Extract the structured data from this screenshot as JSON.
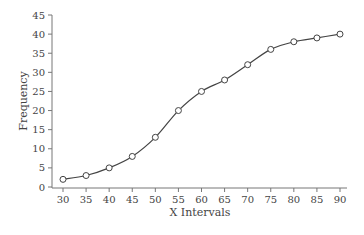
{
  "chart_data": {
    "type": "line",
    "title": "",
    "xlabel": "X Intervals",
    "ylabel": "Frequency",
    "x": [
      30,
      35,
      40,
      45,
      50,
      55,
      60,
      65,
      70,
      75,
      80,
      85,
      90
    ],
    "series": [
      {
        "name": "Frequency",
        "values": [
          2,
          3,
          5,
          8,
          13,
          20,
          25,
          28,
          32,
          36,
          38,
          39,
          40
        ],
        "marker": "open-circle",
        "smooth": true
      }
    ],
    "xticks": [
      30,
      35,
      40,
      45,
      50,
      55,
      60,
      65,
      70,
      75,
      80,
      85,
      90
    ],
    "yticks": [
      0,
      5,
      10,
      15,
      20,
      25,
      30,
      35,
      40,
      45
    ],
    "xlim": [
      30,
      90
    ],
    "ylim": [
      0,
      45
    ],
    "grid": false,
    "legend": null
  }
}
